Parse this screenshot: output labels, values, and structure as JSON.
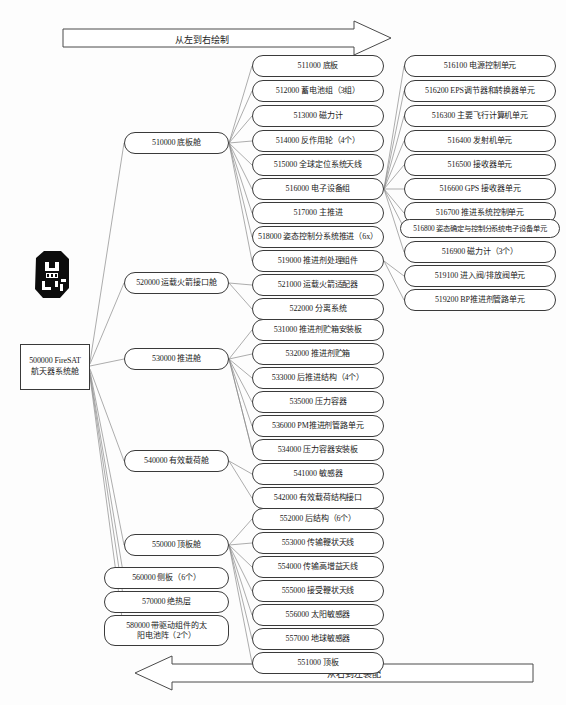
{
  "diagram": {
    "top_arrow_label": "从左到右绘制",
    "bottom_arrow_label": "从右到左装配",
    "root": {
      "id": "500000",
      "label": "500000 FireSAT\n航天器系统舱",
      "line1": "500000 FireSAT",
      "line2": "航天器系统舱",
      "thumbnail_name": "satellite-thumbnail"
    },
    "level1": [
      {
        "id": "510000",
        "label": "510000 底板舱"
      },
      {
        "id": "520000",
        "label": "520000 运载火箭接口舱"
      },
      {
        "id": "530000",
        "label": "530000 推进舱"
      },
      {
        "id": "540000",
        "label": "540000 有效载荷舱"
      },
      {
        "id": "550000",
        "label": "550000 顶板舱"
      },
      {
        "id": "560000",
        "label": "560000 侧板（6个）"
      },
      {
        "id": "570000",
        "label": "570000 绝热层"
      },
      {
        "id": "580000",
        "label": "580000 带驱动组件的太阳电池阵（2个）",
        "line1": "580000 带驱动组件的太",
        "line2": "阳电池阵（2个）"
      }
    ],
    "level2": [
      {
        "id": "511000",
        "label": "511000 底板",
        "parent": "510000"
      },
      {
        "id": "512000",
        "label": "512000 蓄电池组（3组）",
        "parent": "510000"
      },
      {
        "id": "513000",
        "label": "513000 磁力计",
        "parent": "510000"
      },
      {
        "id": "514000",
        "label": "514000 反作用轮（4个）",
        "parent": "510000"
      },
      {
        "id": "515000",
        "label": "515000 全球定位系统天线",
        "parent": "510000"
      },
      {
        "id": "516000",
        "label": "516000 电子设备组",
        "parent": "510000"
      },
      {
        "id": "517000",
        "label": "517000 主推进",
        "parent": "510000"
      },
      {
        "id": "518000",
        "label": "518000 姿态控制分系统推进（6x）",
        "parent": "510000"
      },
      {
        "id": "519000",
        "label": "519000 推进剂处理组件",
        "parent": "510000"
      },
      {
        "id": "521000",
        "label": "521000 运载火箭适配器",
        "parent": "520000"
      },
      {
        "id": "522000",
        "label": "522000 分离系统",
        "parent": "520000"
      },
      {
        "id": "531000",
        "label": "531000 推进剂贮箱安装板",
        "parent": "530000"
      },
      {
        "id": "532000",
        "label": "532000 推进剂贮箱",
        "parent": "530000"
      },
      {
        "id": "533000",
        "label": "533000 后推进结构（4个）",
        "parent": "530000"
      },
      {
        "id": "535000",
        "label": "535000 压力容器",
        "parent": "530000"
      },
      {
        "id": "536000",
        "label": "536000 PM推进剂管路单元",
        "parent": "530000"
      },
      {
        "id": "534000",
        "label": "534000 压力容器安装板",
        "parent": "530000"
      },
      {
        "id": "541000",
        "label": "541000 敏感器",
        "parent": "540000"
      },
      {
        "id": "542000",
        "label": "542000 有效载荷结构接口",
        "parent": "540000"
      },
      {
        "id": "552000",
        "label": "552000 后结构（6个）",
        "parent": "550000"
      },
      {
        "id": "553000",
        "label": "553000 传输鞭状天线",
        "parent": "550000"
      },
      {
        "id": "554000",
        "label": "554000 传输高增益天线",
        "parent": "550000"
      },
      {
        "id": "555000",
        "label": "555000 接受鞭状天线",
        "parent": "550000"
      },
      {
        "id": "556000",
        "label": "556000 太阳敏感器",
        "parent": "550000"
      },
      {
        "id": "557000",
        "label": "557000 地球敏感器",
        "parent": "550000"
      },
      {
        "id": "551000",
        "label": "551000 顶板",
        "parent": "550000"
      }
    ],
    "level3": [
      {
        "id": "516100",
        "label": "516100 电源控制单元",
        "parent": "516000"
      },
      {
        "id": "516200",
        "label": "516200 EPS调节器和转换器单元",
        "parent": "516000"
      },
      {
        "id": "516300",
        "label": "516300 主要飞行计算机单元",
        "parent": "516000"
      },
      {
        "id": "516400",
        "label": "516400 发射机单元",
        "parent": "516000"
      },
      {
        "id": "516500",
        "label": "516500 接收器单元",
        "parent": "516000"
      },
      {
        "id": "516600",
        "label": "516600 GPS 接收器单元",
        "parent": "516000"
      },
      {
        "id": "516700",
        "label": "516700 推进系统控制单元",
        "parent": "516000"
      },
      {
        "id": "516800",
        "label": "516800 姿态确定与控制分系统电子设备单元",
        "parent": "516000"
      },
      {
        "id": "516900",
        "label": "516900 磁力计（3个）",
        "parent": "516000"
      },
      {
        "id": "519100",
        "label": "519100 进入阀/排放阀单元",
        "parent": "519000"
      },
      {
        "id": "519200",
        "label": "519200 BP推进剂管路单元",
        "parent": "519000"
      }
    ],
    "colors": {
      "node_border": "#3a3a3a",
      "node_fill": "#ffffff",
      "edge": "#7a7a7a",
      "text": "#1a1a1a",
      "background": "#fdfdfd",
      "thumbnail": "#0d0d0d"
    }
  }
}
